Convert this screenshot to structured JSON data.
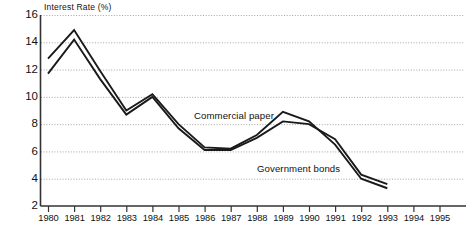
{
  "chart_data": {
    "type": "line",
    "title": "",
    "ylabel": "Interest Rate (%)",
    "xlabel": "",
    "ylim": [
      2,
      16
    ],
    "y_ticks": [
      16,
      14,
      12,
      10,
      8,
      6,
      4,
      2
    ],
    "x_ticks": [
      "1980",
      "1981",
      "1982",
      "1983",
      "1984",
      "1985",
      "1986",
      "1987",
      "1988",
      "1989",
      "1990",
      "1991",
      "1992",
      "1993",
      "1994",
      "1995"
    ],
    "xlim": [
      "1980",
      "1995"
    ],
    "grid": true,
    "legend_position": "inline-annotations",
    "x": [
      1980,
      1981,
      1982,
      1983,
      1984,
      1985,
      1986,
      1987,
      1988,
      1989,
      1990,
      1991,
      1992,
      1993
    ],
    "series": [
      {
        "name": "Commercial paper",
        "color": "#1a1a1a",
        "values": [
          12.8,
          14.9,
          11.9,
          9.0,
          10.2,
          8.0,
          6.3,
          6.2,
          7.2,
          8.9,
          8.2,
          6.5,
          4.0,
          3.3
        ]
      },
      {
        "name": "Government bonds",
        "color": "#1a1a1a",
        "values": [
          11.7,
          14.2,
          11.3,
          8.7,
          10.0,
          7.7,
          6.1,
          6.1,
          7.0,
          8.2,
          8.0,
          6.9,
          4.3,
          3.6
        ]
      }
    ],
    "annotations": [
      {
        "text": "Commercial paper",
        "name": "commercial-paper"
      },
      {
        "text": "Government bonds",
        "name": "government-bonds"
      }
    ],
    "colors": {
      "axis": "#333333",
      "grid": "#9a9a9a",
      "line": "#1a1a1a",
      "text": "#111111"
    }
  }
}
